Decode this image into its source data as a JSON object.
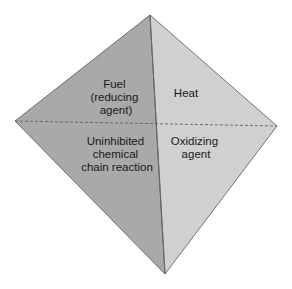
{
  "diagram": {
    "type": "fire-tetrahedron",
    "colors": {
      "left_face": "#a9a9a9",
      "right_face": "#cfcfcf",
      "edge": "#555555",
      "text": "#1a1a1a"
    },
    "faces": [
      {
        "id": "fuel",
        "lines": [
          "Fuel",
          "(reducing",
          "agent)"
        ]
      },
      {
        "id": "heat",
        "lines": [
          "Heat"
        ]
      },
      {
        "id": "chain",
        "lines": [
          "Uninhibited",
          "chemical",
          "chain reaction"
        ]
      },
      {
        "id": "oxidizer",
        "lines": [
          "Oxidizing",
          "agent"
        ]
      }
    ]
  }
}
